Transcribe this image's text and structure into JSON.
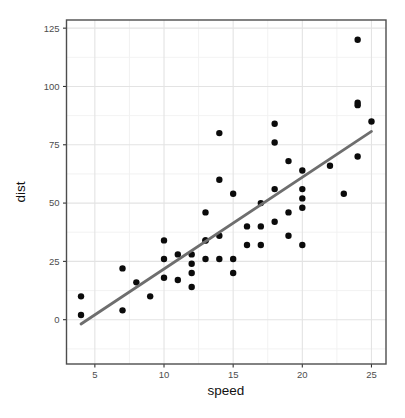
{
  "figure": {
    "background": "#ffffff"
  },
  "chart_data": {
    "type": "scatter",
    "title": "",
    "xlabel": "speed",
    "ylabel": "dist",
    "xlim": [
      2.95,
      26.05
    ],
    "ylim": [
      -19,
      128.5
    ],
    "x_ticks": [
      5,
      10,
      15,
      20,
      25
    ],
    "y_ticks": [
      0,
      25,
      50,
      75,
      100,
      125
    ],
    "x_minor_gridlines": [
      7.5,
      12.5,
      17.5,
      22.5
    ],
    "y_minor_gridlines": [
      -12.5,
      12.5,
      37.5,
      62.5,
      87.5,
      112.5
    ],
    "grid": true,
    "legend": "none",
    "series": [
      {
        "name": "observations",
        "type": "scatter",
        "color": "#0b0b0b",
        "marker_radius": 3.2,
        "points": [
          [
            4,
            2
          ],
          [
            4,
            10
          ],
          [
            7,
            4
          ],
          [
            7,
            22
          ],
          [
            8,
            16
          ],
          [
            9,
            10
          ],
          [
            10,
            18
          ],
          [
            10,
            26
          ],
          [
            10,
            34
          ],
          [
            11,
            17
          ],
          [
            11,
            28
          ],
          [
            12,
            14
          ],
          [
            12,
            20
          ],
          [
            12,
            24
          ],
          [
            12,
            28
          ],
          [
            13,
            26
          ],
          [
            13,
            34
          ],
          [
            13,
            34
          ],
          [
            13,
            46
          ],
          [
            14,
            26
          ],
          [
            14,
            36
          ],
          [
            14,
            60
          ],
          [
            14,
            80
          ],
          [
            15,
            20
          ],
          [
            15,
            26
          ],
          [
            15,
            54
          ],
          [
            16,
            32
          ],
          [
            16,
            40
          ],
          [
            17,
            32
          ],
          [
            17,
            40
          ],
          [
            17,
            50
          ],
          [
            18,
            42
          ],
          [
            18,
            56
          ],
          [
            18,
            76
          ],
          [
            18,
            84
          ],
          [
            19,
            36
          ],
          [
            19,
            46
          ],
          [
            19,
            68
          ],
          [
            20,
            32
          ],
          [
            20,
            48
          ],
          [
            20,
            52
          ],
          [
            20,
            56
          ],
          [
            20,
            64
          ],
          [
            22,
            66
          ],
          [
            23,
            54
          ],
          [
            24,
            70
          ],
          [
            24,
            92
          ],
          [
            24,
            93
          ],
          [
            24,
            120
          ],
          [
            25,
            85
          ]
        ]
      },
      {
        "name": "linear-fit",
        "type": "line",
        "color": "#6e6e6e",
        "line_width": 2.8,
        "points": [
          [
            4,
            -1.85
          ],
          [
            25,
            80.73
          ]
        ]
      }
    ],
    "colors": {
      "panel_bg": "#ffffff",
      "grid_major": "#e3e3e3",
      "grid_minor": "#f0f0f0",
      "panel_border": "#4d4d4d",
      "tick": "#333333",
      "tick_label": "#4d4d4d",
      "axis_title": "#111111"
    }
  }
}
